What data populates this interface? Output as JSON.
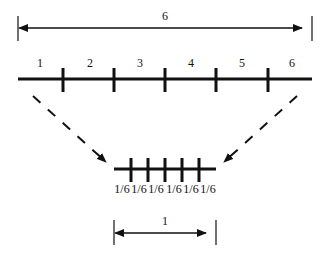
{
  "top_dimension": {
    "label": "6"
  },
  "segments": [
    {
      "label": "1"
    },
    {
      "label": "2"
    },
    {
      "label": "3"
    },
    {
      "label": "4"
    },
    {
      "label": "5"
    },
    {
      "label": "6"
    }
  ],
  "sub_segments": [
    {
      "label": "1/6"
    },
    {
      "label": "1/6"
    },
    {
      "label": "1/6"
    },
    {
      "label": "1/6"
    },
    {
      "label": "1/6"
    },
    {
      "label": "1/6"
    }
  ],
  "bottom_dimension": {
    "label": "1"
  },
  "colors": {
    "stroke": "#111111",
    "background": "#ffffff"
  }
}
